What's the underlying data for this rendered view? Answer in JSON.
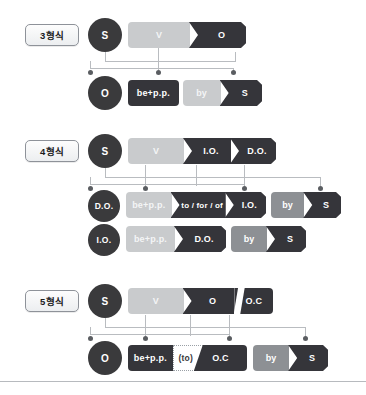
{
  "diagram": {
    "palette": {
      "dark": "#35353a",
      "light_gray": "#c9cbcd",
      "mid_gray": "#8d9094",
      "circle": "#3a3a3c",
      "connector": "#b9bcc0",
      "node": "#5a5d61",
      "chip_border": "#8e9299",
      "white": "#ffffff"
    },
    "sections": [
      {
        "id": "pattern-3",
        "label": "3형식",
        "active": {
          "subject": "S",
          "segments": [
            {
              "text": "V",
              "tone": "light"
            },
            {
              "text": "O",
              "tone": "dark"
            }
          ]
        },
        "passive": {
          "subject": "O",
          "segments": [
            {
              "text": "be+p.p.",
              "tone": "dark"
            },
            {
              "text": "by",
              "tone": "light"
            },
            {
              "text": "S",
              "tone": "dark"
            }
          ]
        }
      },
      {
        "id": "pattern-4",
        "label": "4형식",
        "active": {
          "subject": "S",
          "segments": [
            {
              "text": "V",
              "tone": "light"
            },
            {
              "text": "I.O.",
              "tone": "dark"
            },
            {
              "text": "D.O.",
              "tone": "dark"
            }
          ]
        },
        "passive_rows": [
          {
            "subject": "D.O.",
            "segments": [
              {
                "text": "be+p.p.",
                "tone": "light"
              },
              {
                "text": "to / for / of",
                "tone": "dark"
              },
              {
                "text": "I.O.",
                "tone": "dark"
              },
              {
                "text": "by",
                "tone": "mid"
              },
              {
                "text": "S",
                "tone": "dark"
              }
            ]
          },
          {
            "subject": "I.O.",
            "segments": [
              {
                "text": "be+p.p.",
                "tone": "light"
              },
              {
                "text": "D.O.",
                "tone": "dark"
              },
              {
                "text": "by",
                "tone": "mid"
              },
              {
                "text": "S",
                "tone": "dark"
              }
            ]
          }
        ]
      },
      {
        "id": "pattern-5",
        "label": "5형식",
        "active": {
          "subject": "S",
          "segments": [
            {
              "text": "V",
              "tone": "light"
            },
            {
              "text": "O",
              "tone": "dark"
            },
            {
              "text": "O.C",
              "tone": "dark"
            }
          ]
        },
        "passive": {
          "subject": "O",
          "segments": [
            {
              "text": "be+p.p.",
              "tone": "dark"
            },
            {
              "text": "(to)",
              "tone": "dotted"
            },
            {
              "text": "O.C",
              "tone": "dark"
            },
            {
              "text": "by",
              "tone": "mid"
            },
            {
              "text": "S",
              "tone": "dark"
            }
          ]
        }
      }
    ]
  }
}
